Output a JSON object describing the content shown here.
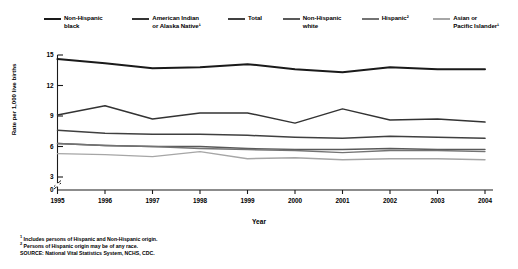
{
  "chart_data": {
    "type": "line",
    "title": "",
    "xlabel": "Year",
    "ylabel": "Rate per 1,000 live births",
    "x": [
      1995,
      1996,
      1997,
      1998,
      1999,
      2000,
      2001,
      2002,
      2003,
      2004
    ],
    "xticklabels": [
      "1995",
      "1996",
      "1997",
      "1998",
      "1999",
      "2000",
      "2001",
      "2002",
      "2003",
      "2004"
    ],
    "yticklabels": [
      "0",
      "3",
      "6",
      "9",
      "12",
      "15"
    ],
    "ytickvalues": [
      0,
      3,
      6,
      9,
      12,
      15
    ],
    "ylim": [
      0,
      15
    ],
    "axis_break": true,
    "grid": false,
    "legend_position": "top",
    "series": [
      {
        "name": "Non-Hispanic black",
        "color": "#1a1a1a",
        "width": 2.0,
        "values": [
          14.6,
          14.2,
          13.7,
          13.8,
          14.1,
          13.6,
          13.3,
          13.8,
          13.6,
          13.6
        ]
      },
      {
        "name": "American Indian or Alaska Native",
        "color": "#333333",
        "width": 1.5,
        "values": [
          9.1,
          10.0,
          8.7,
          9.3,
          9.3,
          8.3,
          9.7,
          8.6,
          8.7,
          8.4
        ]
      },
      {
        "name": "Total",
        "color": "#404040",
        "width": 1.5,
        "values": [
          7.6,
          7.3,
          7.2,
          7.2,
          7.1,
          6.9,
          6.8,
          7.0,
          6.9,
          6.8
        ]
      },
      {
        "name": "Non-Hispanic white",
        "color": "#595959",
        "width": 1.4,
        "values": [
          6.3,
          6.1,
          6.0,
          6.0,
          5.8,
          5.7,
          5.7,
          5.8,
          5.7,
          5.7
        ]
      },
      {
        "name": "Hispanic",
        "color": "#737373",
        "width": 1.4,
        "values": [
          6.3,
          6.1,
          6.0,
          5.8,
          5.7,
          5.6,
          5.4,
          5.6,
          5.6,
          5.5
        ]
      },
      {
        "name": "Asian or Pacific Islander",
        "color": "#a6a6a6",
        "width": 1.4,
        "values": [
          5.3,
          5.2,
          5.0,
          5.5,
          4.8,
          4.9,
          4.7,
          4.8,
          4.8,
          4.7
        ]
      }
    ]
  },
  "legend": {
    "items": [
      {
        "label": "Non-Hispanic\nblack",
        "color": "#1a1a1a",
        "thickness": 2.4
      },
      {
        "label": "American Indian\nor Alaska Native¹",
        "color": "#333333",
        "thickness": 2.0
      },
      {
        "label": "Total",
        "color": "#404040",
        "thickness": 2.0
      },
      {
        "label": "Non-Hispanic\nwhite",
        "color": "#595959",
        "thickness": 2.0
      },
      {
        "label": "Hispanic²",
        "color": "#737373",
        "thickness": 2.0
      },
      {
        "label": "Asian or\nPacific Islander¹",
        "color": "#a6a6a6",
        "thickness": 2.0
      }
    ]
  },
  "axes": {
    "y_title": "Rate per 1,000 live births",
    "x_title": "Year"
  },
  "footnotes": {
    "note1_marker": "1",
    "note1": "Includes persons of Hispanic and Non-Hispanic origin.",
    "note2_marker": "2",
    "note2": "Persons of Hispanic origin may be of any race.",
    "source": "SOURCE: National Vital Statistics System, NCHS, CDC."
  }
}
